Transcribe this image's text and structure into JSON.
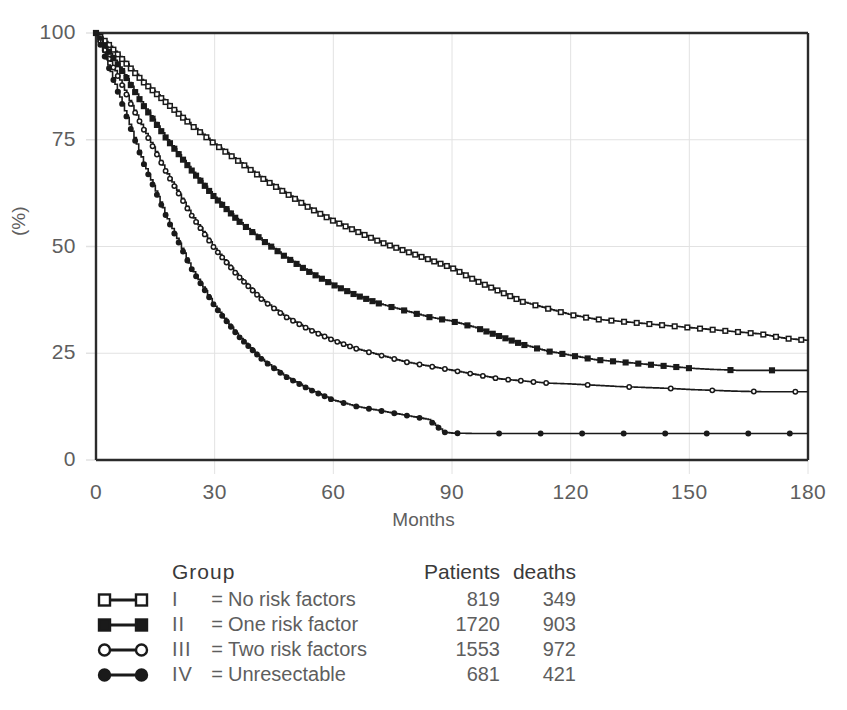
{
  "chart_data": {
    "type": "line",
    "title": "",
    "xlabel": "Months",
    "ylabel": "(%)",
    "xlim": [
      0,
      180
    ],
    "ylim": [
      0,
      100
    ],
    "xticks": [
      0,
      30,
      60,
      90,
      120,
      150,
      180
    ],
    "yticks": [
      0,
      25,
      50,
      75,
      100
    ],
    "grid": true,
    "legend_position": "below-plot",
    "series": [
      {
        "name": "I = No risk factors",
        "roman": "I",
        "label": "No risk factors",
        "marker": "open-square",
        "patients": "819",
        "deaths": "349",
        "x": [
          0,
          3,
          6,
          9,
          12,
          18,
          24,
          30,
          36,
          42,
          48,
          54,
          60,
          66,
          72,
          78,
          84,
          90,
          96,
          102,
          108,
          114,
          120,
          126,
          132,
          138,
          144,
          150,
          156,
          162,
          168,
          174,
          180
        ],
        "y": [
          100,
          97.5,
          94.5,
          91.5,
          88.5,
          83.5,
          78.5,
          74,
          70,
          66,
          62.5,
          59,
          56,
          53.5,
          51,
          49,
          47,
          45,
          42,
          39.5,
          37,
          35.5,
          34,
          33,
          32.5,
          32,
          31.5,
          31,
          30.5,
          30,
          29.5,
          28.5,
          28
        ]
      },
      {
        "name": "II = One risk factor",
        "roman": "II",
        "label": "One risk factor",
        "marker": "filled-square",
        "patients": "1720",
        "deaths": "903",
        "x": [
          0,
          3,
          6,
          9,
          12,
          18,
          24,
          30,
          36,
          42,
          48,
          54,
          60,
          66,
          72,
          78,
          84,
          90,
          96,
          102,
          108,
          114,
          120,
          126,
          132,
          138,
          144,
          150,
          156,
          162,
          168,
          174,
          180
        ],
        "y": [
          100,
          96,
          92,
          87.5,
          83,
          75,
          68,
          61.5,
          56,
          51.5,
          47.5,
          44,
          41,
          38.5,
          36.5,
          35,
          33.5,
          32.5,
          31,
          29,
          27,
          25.5,
          24.5,
          23.5,
          23,
          22.5,
          22,
          21.5,
          21.2,
          21,
          21,
          21,
          21
        ]
      },
      {
        "name": "III = Two risk factors",
        "roman": "III",
        "label": "Two risk factors",
        "marker": "open-circle",
        "patients": "1553",
        "deaths": "972",
        "x": [
          0,
          3,
          6,
          9,
          12,
          18,
          24,
          30,
          36,
          42,
          48,
          54,
          60,
          66,
          72,
          78,
          84,
          90,
          96,
          102,
          108,
          114,
          120,
          126,
          132,
          138,
          144,
          150,
          156,
          162,
          168,
          174,
          180
        ],
        "y": [
          100,
          94.5,
          89,
          83,
          77.5,
          67,
          57.5,
          49.5,
          43,
          37.5,
          33.5,
          30.5,
          28,
          26,
          24.5,
          23,
          22,
          21,
          20,
          19,
          18.5,
          18,
          17.8,
          17.5,
          17.2,
          17,
          16.8,
          16.5,
          16.3,
          16.1,
          16,
          16,
          16
        ]
      },
      {
        "name": "IV = Unresectable",
        "roman": "IV",
        "label": "Unresectable",
        "marker": "filled-circle",
        "patients": "681",
        "deaths": "421",
        "x": [
          0,
          3,
          6,
          9,
          12,
          18,
          24,
          30,
          36,
          42,
          48,
          54,
          60,
          66,
          72,
          78,
          84,
          88,
          90,
          96,
          108,
          120,
          132,
          144,
          150,
          156,
          168,
          180
        ],
        "y": [
          100,
          92.5,
          85,
          77,
          69.5,
          56.5,
          45,
          36,
          29,
          23.5,
          19.5,
          16.5,
          14,
          12.5,
          11.5,
          10.5,
          9.5,
          6.5,
          6.3,
          6.2,
          6.2,
          6.2,
          6.2,
          6.2,
          6.2,
          6.2,
          6.2,
          6.2
        ]
      }
    ]
  },
  "axes": {
    "y_title": "(%)",
    "x_title": "Months",
    "y_tick_labels": [
      "100",
      "75",
      "50",
      "25",
      "0"
    ],
    "x_tick_labels": [
      "0",
      "30",
      "60",
      "90",
      "120",
      "150",
      "180"
    ]
  },
  "legend": {
    "headers": {
      "group": "Group",
      "patients": "Patients",
      "deaths": "deaths"
    },
    "equals": "=",
    "rows": [
      {
        "roman": "I",
        "name": "No risk factors",
        "patients": "819",
        "deaths": "349",
        "marker": "open-square"
      },
      {
        "roman": "II",
        "name": "One risk factor",
        "patients": "1720",
        "deaths": "903",
        "marker": "filled-square"
      },
      {
        "roman": "III",
        "name": "Two risk factors",
        "patients": "1553",
        "deaths": "972",
        "marker": "open-circle"
      },
      {
        "roman": "IV",
        "name": "Unresectable",
        "patients": "681",
        "deaths": "421",
        "marker": "filled-circle"
      }
    ]
  },
  "colors": {
    "ink": "#1a1a1a",
    "grid": "#e2e2e2",
    "axis": "#2b2b2b",
    "text": "#5e5e5e"
  }
}
